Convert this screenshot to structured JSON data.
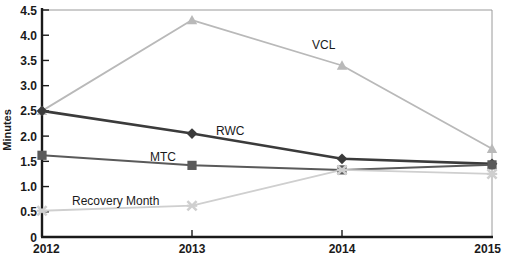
{
  "chart_data": {
    "type": "line",
    "title": "",
    "xlabel": "",
    "ylabel": "Minutes",
    "categories": [
      "2012",
      "2013",
      "2014",
      "2015"
    ],
    "x": [
      2012,
      2013,
      2014,
      2015
    ],
    "xlim": [
      2012,
      2015
    ],
    "ylim": [
      0,
      4.5
    ],
    "yticks": [
      "0",
      "0.5",
      "1.0",
      "1.5",
      "2.0",
      "2.5",
      "3.0",
      "3.5",
      "4.0",
      "4.5"
    ],
    "ytick_values": [
      0,
      0.5,
      1.0,
      1.5,
      2.0,
      2.5,
      3.0,
      3.5,
      4.0,
      4.5
    ],
    "grid": false,
    "legend": "inline-annotations",
    "series": [
      {
        "name": "VCL",
        "values": [
          2.5,
          4.3,
          3.4,
          1.75
        ],
        "color": "#b9b9b9",
        "marker": "triangle",
        "label_x": 312,
        "label_y": 49
      },
      {
        "name": "RWC",
        "values": [
          2.5,
          2.05,
          1.55,
          1.45
        ],
        "color": "#3b3b3b",
        "marker": "diamond",
        "label_x": 216,
        "label_y": 135
      },
      {
        "name": "MTC",
        "values": [
          1.62,
          1.42,
          1.33,
          1.43
        ],
        "color": "#5a5a5a",
        "marker": "square",
        "label_x": 150,
        "label_y": 161
      },
      {
        "name": "Recovery Month",
        "values": [
          0.52,
          0.62,
          1.33,
          1.25
        ],
        "color": "#cfcfcf",
        "marker": "x",
        "label_x": 72,
        "label_y": 205
      }
    ],
    "axis_color": "#1a1a1a",
    "frame_color": "#9a9a9a"
  },
  "axis": {
    "y_title": "Minutes",
    "x_tick_labels": [
      "2012",
      "2013",
      "2014",
      "2015"
    ],
    "y_tick_labels": [
      "4.5",
      "4.0",
      "3.5",
      "3.0",
      "2.5",
      "2.0",
      "1.5",
      "1.0",
      "0.5",
      "0"
    ]
  }
}
